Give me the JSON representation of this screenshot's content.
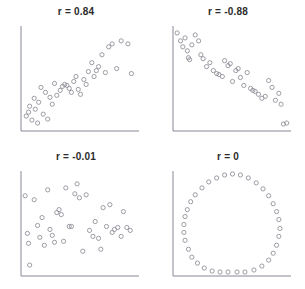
{
  "figure": {
    "type": "scatter-matrix",
    "background_color": "#ffffff",
    "marker_color": "#8b8b96",
    "axis_color": "#7a7a8c",
    "title_color": "#2b2b2b",
    "panel_count": 4
  },
  "chart_data": [
    {
      "type": "scatter",
      "title": "r = 0.84",
      "xlabel": "",
      "ylabel": "",
      "xlim": [
        0,
        100
      ],
      "ylim": [
        0,
        100
      ],
      "grid": false,
      "legend": "none",
      "correlation": 0.84,
      "n_points": 40,
      "points": [
        [
          2,
          12
        ],
        [
          4,
          16
        ],
        [
          5,
          22
        ],
        [
          7,
          8
        ],
        [
          9,
          30
        ],
        [
          10,
          19
        ],
        [
          12,
          5
        ],
        [
          13,
          26
        ],
        [
          15,
          41
        ],
        [
          17,
          14
        ],
        [
          19,
          36
        ],
        [
          21,
          9
        ],
        [
          23,
          31
        ],
        [
          25,
          24
        ],
        [
          27,
          45
        ],
        [
          29,
          33
        ],
        [
          32,
          38
        ],
        [
          34,
          42
        ],
        [
          36,
          44
        ],
        [
          38,
          43
        ],
        [
          40,
          40
        ],
        [
          42,
          36
        ],
        [
          44,
          47
        ],
        [
          46,
          52
        ],
        [
          48,
          39
        ],
        [
          50,
          34
        ],
        [
          53,
          49
        ],
        [
          55,
          44
        ],
        [
          57,
          57
        ],
        [
          60,
          66
        ],
        [
          62,
          52
        ],
        [
          64,
          58
        ],
        [
          66,
          62
        ],
        [
          69,
          74
        ],
        [
          72,
          56
        ],
        [
          75,
          82
        ],
        [
          78,
          85
        ],
        [
          82,
          60
        ],
        [
          86,
          88
        ],
        [
          92,
          85
        ],
        [
          95,
          55
        ]
      ]
    },
    {
      "type": "scatter",
      "title": "r = -0.88",
      "xlabel": "",
      "ylabel": "",
      "xlim": [
        0,
        100
      ],
      "ylim": [
        0,
        100
      ],
      "grid": false,
      "legend": "none",
      "correlation": -0.88,
      "n_points": 40,
      "points": [
        [
          1,
          96
        ],
        [
          4,
          88
        ],
        [
          6,
          82
        ],
        [
          8,
          91
        ],
        [
          10,
          78
        ],
        [
          11,
          71
        ],
        [
          12,
          69
        ],
        [
          14,
          84
        ],
        [
          17,
          94
        ],
        [
          20,
          88
        ],
        [
          22,
          74
        ],
        [
          24,
          70
        ],
        [
          27,
          62
        ],
        [
          30,
          66
        ],
        [
          33,
          58
        ],
        [
          36,
          55
        ],
        [
          38,
          54
        ],
        [
          41,
          52
        ],
        [
          43,
          68
        ],
        [
          46,
          63
        ],
        [
          48,
          65
        ],
        [
          50,
          47
        ],
        [
          53,
          58
        ],
        [
          55,
          60
        ],
        [
          57,
          51
        ],
        [
          60,
          43
        ],
        [
          63,
          56
        ],
        [
          66,
          40
        ],
        [
          68,
          38
        ],
        [
          70,
          37
        ],
        [
          73,
          34
        ],
        [
          76,
          30
        ],
        [
          79,
          32
        ],
        [
          82,
          48
        ],
        [
          85,
          41
        ],
        [
          88,
          28
        ],
        [
          91,
          35
        ],
        [
          93,
          24
        ],
        [
          95,
          4
        ],
        [
          98,
          5
        ]
      ]
    },
    {
      "type": "scatter",
      "title": "r = -0.01",
      "xlabel": "",
      "ylabel": "",
      "xlim": [
        0,
        100
      ],
      "ylim": [
        0,
        100
      ],
      "grid": false,
      "legend": "none",
      "correlation": -0.01,
      "n_points": 40,
      "points": [
        [
          1,
          78
        ],
        [
          3,
          40
        ],
        [
          4,
          30
        ],
        [
          5,
          8
        ],
        [
          9,
          74
        ],
        [
          12,
          48
        ],
        [
          14,
          36
        ],
        [
          16,
          56
        ],
        [
          18,
          28
        ],
        [
          21,
          84
        ],
        [
          23,
          44
        ],
        [
          25,
          38
        ],
        [
          27,
          31
        ],
        [
          29,
          61
        ],
        [
          31,
          64
        ],
        [
          33,
          59
        ],
        [
          35,
          32
        ],
        [
          37,
          86
        ],
        [
          40,
          47
        ],
        [
          42,
          47
        ],
        [
          45,
          80
        ],
        [
          47,
          90
        ],
        [
          49,
          76
        ],
        [
          52,
          22
        ],
        [
          55,
          79
        ],
        [
          58,
          43
        ],
        [
          61,
          37
        ],
        [
          63,
          52
        ],
        [
          66,
          35
        ],
        [
          68,
          24
        ],
        [
          70,
          66
        ],
        [
          73,
          47
        ],
        [
          76,
          69
        ],
        [
          78,
          41
        ],
        [
          80,
          44
        ],
        [
          83,
          46
        ],
        [
          86,
          37
        ],
        [
          88,
          62
        ],
        [
          91,
          46
        ],
        [
          94,
          43
        ]
      ]
    },
    {
      "type": "scatter",
      "title": "r = 0",
      "xlabel": "",
      "ylabel": "",
      "xlim": [
        0,
        100
      ],
      "ylim": [
        0,
        100
      ],
      "grid": false,
      "legend": "none",
      "correlation": 0,
      "n_points": 40,
      "shape": "circle",
      "points": [
        [
          50,
          100
        ],
        [
          43,
          99
        ],
        [
          57,
          99
        ],
        [
          36,
          96
        ],
        [
          64,
          96
        ],
        [
          29,
          92
        ],
        [
          71,
          91
        ],
        [
          23,
          86
        ],
        [
          77,
          85
        ],
        [
          17,
          79
        ],
        [
          82,
          78
        ],
        [
          13,
          72
        ],
        [
          86,
          70
        ],
        [
          10,
          64
        ],
        [
          89,
          62
        ],
        [
          8,
          57
        ],
        [
          91,
          54
        ],
        [
          7,
          49
        ],
        [
          92,
          45
        ],
        [
          7,
          41
        ],
        [
          91,
          37
        ],
        [
          8,
          33
        ],
        [
          89,
          28
        ],
        [
          11,
          24
        ],
        [
          86,
          20
        ],
        [
          14,
          16
        ],
        [
          82,
          13
        ],
        [
          19,
          10
        ],
        [
          76,
          7
        ],
        [
          25,
          5
        ],
        [
          69,
          3
        ],
        [
          32,
          2
        ],
        [
          61,
          1
        ],
        [
          39,
          1
        ],
        [
          54,
          1
        ],
        [
          46,
          1
        ]
      ]
    }
  ]
}
